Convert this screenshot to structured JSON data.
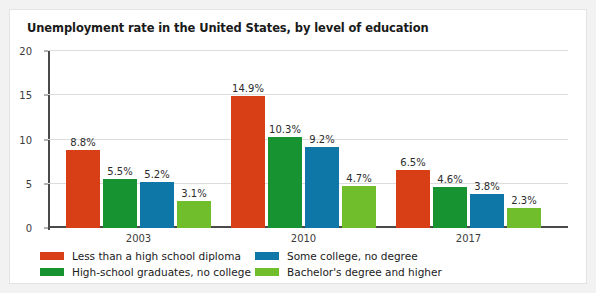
{
  "card": {
    "background": "#ffffff",
    "border_color": "#e3e3e3",
    "page_background": "#f2f2f2"
  },
  "chart_data": {
    "type": "bar",
    "title": "Unemployment rate in the United States, by level of education",
    "xlabel": "",
    "ylabel": "",
    "ylim": [
      0,
      20
    ],
    "yticks": [
      0,
      5,
      10,
      15,
      20
    ],
    "ytick_labels": [
      "0",
      "5",
      "10",
      "15",
      "20"
    ],
    "grid": true,
    "grid_axis": "y",
    "legend_position": "bottom",
    "categories": [
      "2003",
      "2010",
      "2017"
    ],
    "series": [
      {
        "name": "Less than a high school diploma",
        "color": "#d93f16",
        "values": [
          8.8,
          14.9,
          6.5
        ],
        "labels": [
          "8.8%",
          "14.9%",
          "6.5%"
        ]
      },
      {
        "name": "High-school graduates, no college",
        "color": "#179431",
        "values": [
          5.5,
          10.3,
          4.6
        ],
        "labels": [
          "5.5%",
          "10.3%",
          "4.6%"
        ]
      },
      {
        "name": "Some college, no degree",
        "color": "#0f77a8",
        "values": [
          5.2,
          9.2,
          3.8
        ],
        "labels": [
          "5.2%",
          "9.2%",
          "3.8%"
        ]
      },
      {
        "name": "Bachelor's degree and higher",
        "color": "#71be2c",
        "values": [
          3.1,
          4.7,
          2.3
        ],
        "labels": [
          "3.1%",
          "4.7%",
          "2.3%"
        ]
      }
    ],
    "legend": [
      {
        "label": "Less than a high school diploma",
        "color": "#d93f16"
      },
      {
        "label": "Some college, no degree",
        "color": "#0f77a8"
      },
      {
        "label": "High-school graduates, no college",
        "color": "#179431"
      },
      {
        "label": "Bachelor's degree and higher",
        "color": "#71be2c"
      }
    ]
  }
}
